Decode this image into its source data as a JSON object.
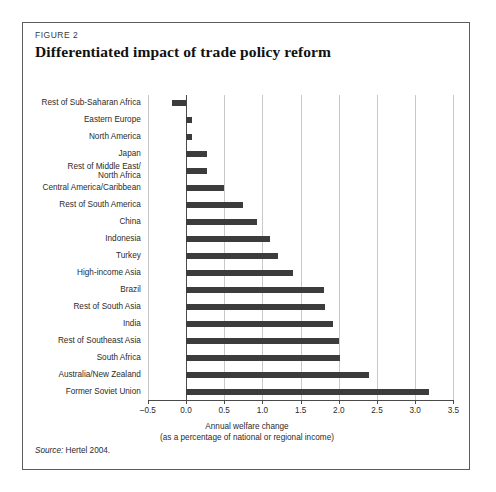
{
  "figure": {
    "kicker": "FIGURE 2",
    "title": "Differentiated impact of trade policy reform",
    "source_label": "Source:",
    "source_text": "Hertel 2004."
  },
  "chart_data": {
    "type": "bar",
    "orientation": "horizontal",
    "title": "Differentiated impact of trade policy reform",
    "xlabel_line1": "Annual welfare change",
    "xlabel_line2": "(as a percentage of national or regional income)",
    "ylabel": "",
    "xlim": [
      -0.5,
      3.5
    ],
    "xticks": [
      -0.5,
      0.0,
      0.5,
      1.0,
      1.5,
      2.0,
      2.5,
      3.0,
      3.5
    ],
    "xticklabels": [
      "–0.5",
      "0.0",
      "0.5",
      "1.0",
      "1.5",
      "2.0",
      "2.5",
      "3.0",
      "3.5"
    ],
    "grid": true,
    "legend": "none",
    "bar_color": "#3c3c3c",
    "categories": [
      "Rest of Sub-Saharan Africa",
      "Eastern Europe",
      "North America",
      "Japan",
      "Rest of Middle East/ North Africa",
      "Central America/Caribbean",
      "Rest of South America",
      "China",
      "Indonesia",
      "Turkey",
      "High-income Asia",
      "Brazil",
      "Rest of South Asia",
      "India",
      "Rest of Southeast Asia",
      "South Africa",
      "Australia/New Zealand",
      "Former Soviet Union"
    ],
    "values": [
      -0.18,
      0.08,
      0.08,
      0.28,
      0.28,
      0.5,
      0.75,
      0.93,
      1.1,
      1.2,
      1.4,
      1.8,
      1.82,
      1.92,
      2.0,
      2.02,
      2.4,
      3.18
    ]
  },
  "category_labels": [
    {
      "line1": "Rest of Sub-Saharan Africa",
      "line2": ""
    },
    {
      "line1": "Eastern Europe",
      "line2": ""
    },
    {
      "line1": "North America",
      "line2": ""
    },
    {
      "line1": "Japan",
      "line2": ""
    },
    {
      "line1": "Rest of Middle East/",
      "line2": "North Africa"
    },
    {
      "line1": "Central America/Caribbean",
      "line2": ""
    },
    {
      "line1": "Rest of South America",
      "line2": ""
    },
    {
      "line1": "China",
      "line2": ""
    },
    {
      "line1": "Indonesia",
      "line2": ""
    },
    {
      "line1": "Turkey",
      "line2": ""
    },
    {
      "line1": "High-income Asia",
      "line2": ""
    },
    {
      "line1": "Brazil",
      "line2": ""
    },
    {
      "line1": "Rest of South Asia",
      "line2": ""
    },
    {
      "line1": "India",
      "line2": ""
    },
    {
      "line1": "Rest of Southeast Asia",
      "line2": ""
    },
    {
      "line1": "South Africa",
      "line2": ""
    },
    {
      "line1": "Australia/New Zealand",
      "line2": ""
    },
    {
      "line1": "Former Soviet Union",
      "line2": ""
    }
  ]
}
